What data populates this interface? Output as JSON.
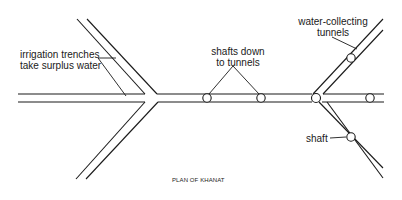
{
  "diagram": {
    "title": "PLAN OF KHANAT",
    "labels": {
      "irrigation_line1": "irrigation trenches",
      "irrigation_line2": "take surplus water",
      "shafts_line1": "shafts down",
      "shafts_line2": "to tunnels",
      "collecting_line1": "water-collecting",
      "collecting_line2": "tunnels",
      "shaft": "shaft"
    },
    "colors": {
      "line": "#1a1a1a",
      "background": "#ffffff"
    }
  }
}
